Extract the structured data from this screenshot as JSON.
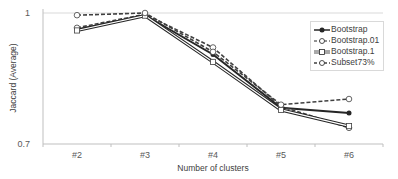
{
  "chart_data": {
    "type": "line",
    "title": "",
    "xlabel": "Number of clusters",
    "ylabel": "Jaccard (Average)",
    "categories": [
      "#2",
      "#3",
      "#4",
      "#5",
      "#6"
    ],
    "ylim": [
      0.7,
      1
    ],
    "yticks": [
      "1",
      "0.7"
    ],
    "grid": true,
    "legend_position": "upper-right",
    "series": [
      {
        "name": "Bootstrap",
        "marker": "filled-circle",
        "line": "solid",
        "values": [
          0.962,
          0.995,
          0.905,
          0.783,
          0.771
        ]
      },
      {
        "name": "Bootstrap.01",
        "marker": "open-circle",
        "line": "dashed",
        "values": [
          0.966,
          0.997,
          0.921,
          0.786,
          0.737
        ]
      },
      {
        "name": "Bootstrap.1",
        "marker": "open-square",
        "line": "double",
        "values": [
          0.96,
          0.994,
          0.888,
          0.778,
          0.741
        ]
      },
      {
        "name": "Subset73%",
        "marker": "open-circle",
        "line": "dashed",
        "values": [
          0.995,
          1.0,
          0.911,
          0.79,
          0.803
        ]
      }
    ]
  },
  "legend": {
    "items": [
      "Bootstrap",
      "Bootstrap.01",
      "Bootstrap.1",
      "Subset73%"
    ]
  },
  "axes": {
    "x_title": "Number of clusters",
    "y_title": "Jaccard (Average)",
    "y_top": "1",
    "y_bottom": "0.7",
    "x_ticks": [
      "#2",
      "#3",
      "#4",
      "#5",
      "#6"
    ]
  },
  "colors": {
    "line": "#262626",
    "grid": "#d9d9d9",
    "axis": "#bfbfbf"
  }
}
